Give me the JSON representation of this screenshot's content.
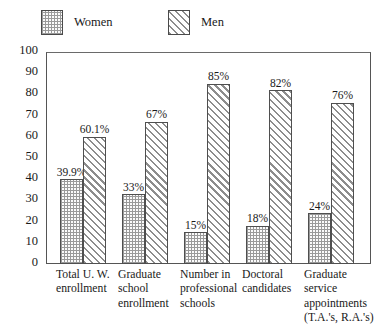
{
  "legend": {
    "entries": [
      {
        "label": "Women",
        "pattern": "dotted-grid",
        "color": "#9a9a9a"
      },
      {
        "label": "Men",
        "pattern": "diagonal-hatch",
        "color": "#8d8d8d"
      }
    ]
  },
  "axes": {
    "y_ticks": [
      "100",
      "90",
      "80",
      "70",
      "60",
      "50",
      "40",
      "30",
      "20",
      "10",
      "0"
    ]
  },
  "chart_data": {
    "type": "bar",
    "title": "",
    "subtitle": "",
    "xlabel": "",
    "ylabel": "",
    "ylim": [
      0,
      100
    ],
    "ytick_step": 10,
    "grid": false,
    "legend_position": "top-left",
    "categories": [
      "Total U. W. enrollment",
      "Graduate school enrollment",
      "Number in professional schools",
      "Doctoral candidates",
      "Graduate service appointments (T.A.'s, R.A.'s)"
    ],
    "category_lines": [
      [
        "Total U. W.",
        "enrollment"
      ],
      [
        "Graduate",
        "school",
        "enrollment"
      ],
      [
        "Number in",
        "professional",
        "schools"
      ],
      [
        "Doctoral",
        "candidates"
      ],
      [
        "Graduate",
        "service",
        "appointments",
        "(T.A.'s, R.A.'s)"
      ]
    ],
    "series": [
      {
        "name": "Women",
        "values": [
          39.9,
          33,
          15,
          18,
          24
        ],
        "labels": [
          "39.9%",
          "33%",
          "15%",
          "18%",
          "24%"
        ]
      },
      {
        "name": "Men",
        "values": [
          60.1,
          67,
          85,
          82,
          76
        ],
        "labels": [
          "60.1%",
          "67%",
          "85%",
          "82%",
          "76%"
        ]
      }
    ]
  }
}
